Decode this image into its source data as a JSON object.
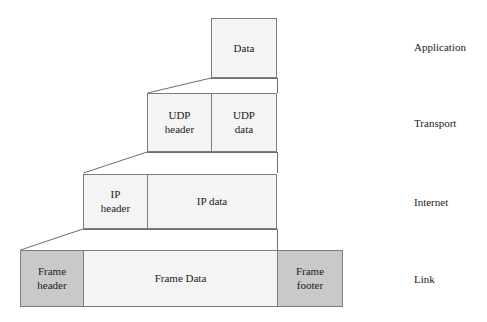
{
  "diagram": {
    "colors": {
      "fill_light": "#f4f4f4",
      "fill_dark": "#c9c9c9",
      "stroke": "#7d7d7d",
      "text": "#1b1b1b",
      "background": "#ffffff"
    },
    "layers": [
      {
        "name": "application",
        "label": "Application",
        "boxes": [
          {
            "name": "data-box",
            "label": "Data",
            "shade": "light"
          }
        ]
      },
      {
        "name": "transport",
        "label": "Transport",
        "boxes": [
          {
            "name": "udp-header-box",
            "label_line1": "UDP",
            "label_line2": "header",
            "shade": "light"
          },
          {
            "name": "udp-data-box",
            "label_line1": "UDP",
            "label_line2": "data",
            "shade": "light"
          }
        ]
      },
      {
        "name": "internet",
        "label": "Internet",
        "boxes": [
          {
            "name": "ip-header-box",
            "label_line1": "IP",
            "label_line2": "header",
            "shade": "light"
          },
          {
            "name": "ip-data-box",
            "label": "IP data",
            "shade": "light"
          }
        ]
      },
      {
        "name": "link",
        "label": "Link",
        "boxes": [
          {
            "name": "frame-header-box",
            "label_line1": "Frame",
            "label_line2": "header",
            "shade": "dark"
          },
          {
            "name": "frame-data-box",
            "label": "Frame Data",
            "shade": "light"
          },
          {
            "name": "frame-footer-box",
            "label_line1": "Frame",
            "label_line2": "footer",
            "shade": "dark"
          }
        ]
      }
    ]
  }
}
